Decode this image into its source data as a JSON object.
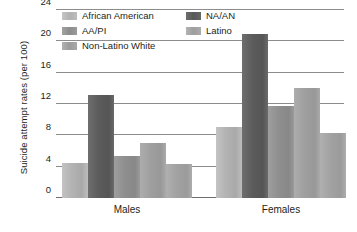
{
  "chart_data": {
    "type": "bar",
    "title": "",
    "xlabel": "",
    "ylabel": "Suicide attempt rates (per 100)",
    "categories": [
      "Males",
      "Females"
    ],
    "series": [
      {
        "name": "African American",
        "color": "#b4b4b4",
        "values": [
          4.5,
          9.1
        ]
      },
      {
        "name": "NA/AN",
        "color": "#585858",
        "values": [
          13.1,
          21.0
        ]
      },
      {
        "name": "AA/PI",
        "color": "#8f8f8f",
        "values": [
          5.3,
          11.7
        ]
      },
      {
        "name": "Non-Latino White",
        "color": "#9f9f9f",
        "values": [
          7.0,
          14.0
        ]
      },
      {
        "name": "Latino",
        "color": "#a2a2a2",
        "values": [
          4.4,
          8.3
        ]
      }
    ],
    "ylim": [
      0,
      24
    ],
    "yticks": [
      0,
      4,
      8,
      12,
      16,
      20,
      24
    ],
    "ytick_labels": [
      "0",
      "4",
      "8",
      "12",
      "16",
      "20",
      "24"
    ],
    "grid": true,
    "legend_position": "top-inside"
  },
  "legend": {
    "items": [
      {
        "label": "African American",
        "swatch": "aa"
      },
      {
        "label": "AA/PI",
        "swatch": "aapi"
      },
      {
        "label": "Non-Latino White",
        "swatch": "nlw"
      },
      {
        "label": "NA/AN",
        "swatch": "naan"
      },
      {
        "label": "Latino",
        "swatch": "lat"
      }
    ]
  },
  "axis": {
    "y_title": "Suicide attempt rates (per 100)",
    "y_labels": [
      "0",
      "4",
      "8",
      "12",
      "16",
      "20",
      "24"
    ],
    "x_labels": [
      "Males",
      "Females"
    ]
  }
}
